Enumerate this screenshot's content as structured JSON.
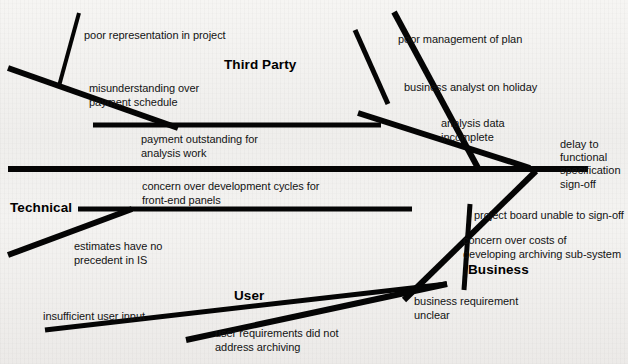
{
  "diagram": {
    "type": "fishbone-ishikawa",
    "effect": {
      "text": "delay to\nfunctional\nspecification\nsign-off",
      "x": 560,
      "y": 138
    },
    "categories": [
      {
        "id": "third-party",
        "label": "Third Party",
        "x": 224,
        "y": 57
      },
      {
        "id": "technical",
        "label": "Technical",
        "x": 10,
        "y": 200
      },
      {
        "id": "user",
        "label": "User",
        "x": 234,
        "y": 288
      },
      {
        "id": "business",
        "label": "Business",
        "x": 468,
        "y": 262
      }
    ],
    "causes": [
      {
        "id": "c1",
        "category": "third-party",
        "text": "poor representation in project",
        "x": 84,
        "y": 29
      },
      {
        "id": "c2",
        "category": "third-party",
        "text": "misunderstanding over\npayment schedule",
        "x": 89,
        "y": 82
      },
      {
        "id": "c3",
        "category": "third-party",
        "text": "payment outstanding for\nanalysis work",
        "x": 141,
        "y": 133
      },
      {
        "id": "c4",
        "category": "third-party",
        "text": "poor management of plan",
        "x": 398,
        "y": 33
      },
      {
        "id": "c5",
        "category": "third-party",
        "text": "business analyst on holiday",
        "x": 404,
        "y": 81
      },
      {
        "id": "c6",
        "category": "third-party",
        "text": "analysis data\nincomplete",
        "x": 441,
        "y": 117
      },
      {
        "id": "c7",
        "category": "technical",
        "text": "concern over development cycles for\nfront-end panels",
        "x": 142,
        "y": 180
      },
      {
        "id": "c8",
        "category": "technical",
        "text": "estimates have no\nprecedent in IS",
        "x": 74,
        "y": 240
      },
      {
        "id": "c9",
        "category": "business",
        "text": "project board unable to sign-off",
        "x": 474,
        "y": 209
      },
      {
        "id": "c10",
        "category": "business",
        "text": "concern over costs of\ndeveloping archiving sub-system",
        "x": 463,
        "y": 234
      },
      {
        "id": "c11",
        "category": "business",
        "text": "business requirement\nunclear",
        "x": 414,
        "y": 295
      },
      {
        "id": "c12",
        "category": "user",
        "text": "insufficient user input",
        "x": 43,
        "y": 310
      },
      {
        "id": "c13",
        "category": "user",
        "text": "user requirements did not\naddress archiving",
        "x": 215,
        "y": 327
      }
    ],
    "bones": {
      "stroke_color": "#050505",
      "spine": {
        "x1": 8,
        "y1": 169,
        "x2": 588,
        "y2": 169,
        "width": 6
      },
      "branches": [
        {
          "id": "third-party-left-rib",
          "x1": 8,
          "y1": 68,
          "x2": 178,
          "y2": 128,
          "width": 6
        },
        {
          "id": "third-party-left-twig",
          "x1": 79,
          "y1": 13,
          "x2": 59,
          "y2": 86,
          "width": 4
        },
        {
          "id": "third-party-left-horiz",
          "x1": 93,
          "y1": 125,
          "x2": 381,
          "y2": 125,
          "width": 5
        },
        {
          "id": "third-party-right-rib",
          "x1": 394,
          "y1": 12,
          "x2": 478,
          "y2": 168,
          "width": 6
        },
        {
          "id": "third-party-right-twig",
          "x1": 355,
          "y1": 30,
          "x2": 388,
          "y2": 104,
          "width": 5
        },
        {
          "id": "third-party-diag",
          "x1": 358,
          "y1": 113,
          "x2": 530,
          "y2": 168,
          "width": 6
        },
        {
          "id": "technical-rib",
          "x1": 78,
          "y1": 209,
          "x2": 412,
          "y2": 209,
          "width": 5
        },
        {
          "id": "technical-twig",
          "x1": 8,
          "y1": 255,
          "x2": 132,
          "y2": 209,
          "width": 6
        },
        {
          "id": "business-rib",
          "x1": 404,
          "y1": 300,
          "x2": 536,
          "y2": 171,
          "width": 6
        },
        {
          "id": "business-twig",
          "x1": 464,
          "y1": 290,
          "x2": 470,
          "y2": 204,
          "width": 5
        },
        {
          "id": "user-rib",
          "x1": 45,
          "y1": 330,
          "x2": 447,
          "y2": 284,
          "width": 5
        },
        {
          "id": "user-twig",
          "x1": 186,
          "y1": 340,
          "x2": 447,
          "y2": 284,
          "width": 6
        }
      ]
    }
  }
}
